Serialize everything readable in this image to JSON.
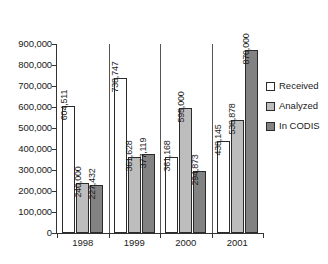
{
  "chart_data": {
    "type": "bar",
    "title": "",
    "subtitle": "",
    "xlabel": "",
    "ylabel": "",
    "categories": [
      "1998",
      "1999",
      "2000",
      "2001"
    ],
    "series": [
      {
        "name": "Received",
        "color": "#ffffff",
        "values": [
          604511,
          738747,
          361168,
          438145
        ],
        "labels": [
          "604,511",
          "738,747",
          "361,168",
          "438,145"
        ]
      },
      {
        "name": "Analyzed",
        "color": "#bdbdbd",
        "values": [
          240000,
          361628,
          595000,
          538878
        ],
        "labels": [
          "240,000",
          "361,628",
          "595,000",
          "538,878"
        ]
      },
      {
        "name": "In CODIS",
        "color": "#828282",
        "values": [
          227432,
          377119,
          294873,
          870000
        ],
        "labels": [
          "227,432",
          "377,119",
          "294,873",
          "870,000"
        ]
      }
    ],
    "ylim": [
      0,
      900000
    ],
    "ytick_values": [
      0,
      100000,
      200000,
      300000,
      400000,
      500000,
      600000,
      700000,
      800000,
      900000
    ],
    "ytick_labels": [
      "0",
      "100,000",
      "200,000",
      "300,000",
      "400,000",
      "500,000",
      "600,000",
      "700,000",
      "800,000",
      "900,000"
    ],
    "grid": false,
    "legend_position": "right",
    "data_labels_rotated": true
  },
  "legend": {
    "items": [
      {
        "label": "Received",
        "color": "#ffffff"
      },
      {
        "label": "Analyzed",
        "color": "#bdbdbd"
      },
      {
        "label": "In CODIS",
        "color": "#828282"
      }
    ]
  }
}
